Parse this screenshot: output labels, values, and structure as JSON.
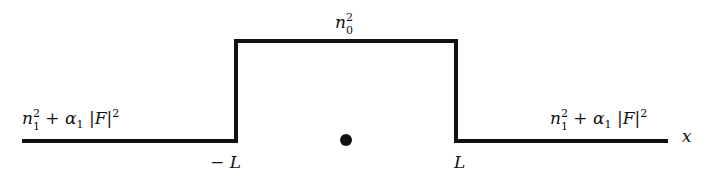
{
  "diagram": {
    "type": "refractive-index-profile",
    "axis_label": "x",
    "core_label": {
      "base": "n",
      "subscript": "0",
      "superscript": "2"
    },
    "cladding_left_label": {
      "n": "n",
      "n_sub": "1",
      "n_sup": "2",
      "plus": "+",
      "alpha": "α",
      "alpha_sub": "1",
      "abs_open": "|",
      "F": "F",
      "abs_close": "|",
      "sup": "2"
    },
    "cladding_right_label": {
      "n": "n",
      "n_sub": "1",
      "n_sup": "2",
      "plus": "+",
      "alpha": "α",
      "alpha_sub": "1",
      "abs_open": "|",
      "F": "F",
      "abs_close": "|",
      "sup": "2"
    },
    "left_boundary_label": "− L",
    "right_boundary_label": "L",
    "center_marker": "dot",
    "colors": {
      "line": "#111111",
      "background": "#ffffff"
    }
  }
}
